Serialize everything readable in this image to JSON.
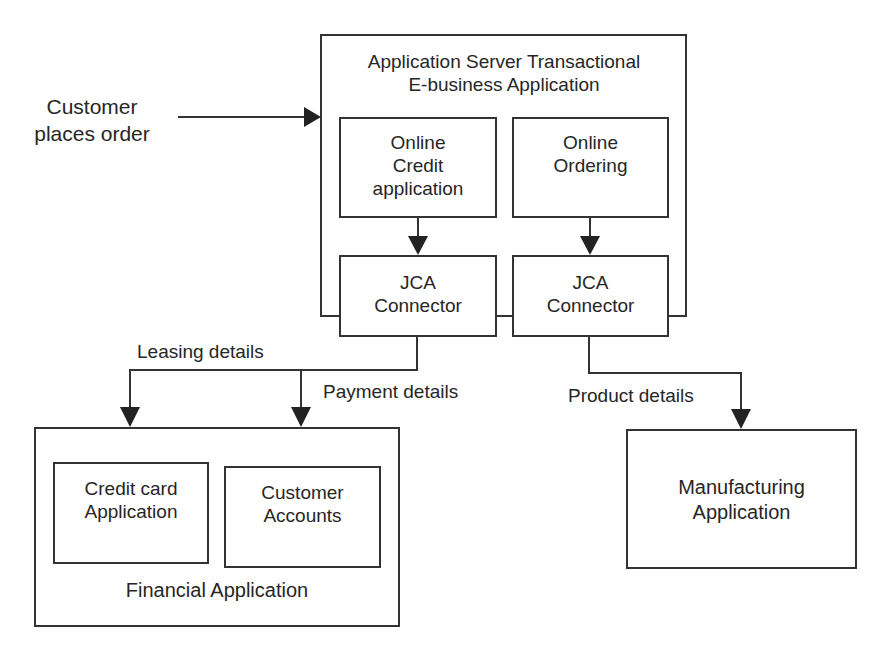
{
  "diagram": {
    "external_input": {
      "line1": "Customer",
      "line2": "places order"
    },
    "app_server": {
      "title_line1": "Application Server Transactional",
      "title_line2": "E-business Application",
      "modules": [
        {
          "line1": "Online",
          "line2": "Credit",
          "line3": "application"
        },
        {
          "line1": "Online",
          "line2": "Ordering",
          "line3": ""
        }
      ],
      "connectors": [
        {
          "line1": "JCA",
          "line2": "Connector"
        },
        {
          "line1": "JCA",
          "line2": "Connector"
        }
      ]
    },
    "flow_labels": {
      "leasing": "Leasing details",
      "payment": "Payment details",
      "product": "Product details"
    },
    "financial": {
      "title": "Financial Application",
      "modules": [
        {
          "line1": "Credit card",
          "line2": "Application"
        },
        {
          "line1": "Customer",
          "line2": "Accounts"
        }
      ]
    },
    "manufacturing": {
      "line1": "Manufacturing",
      "line2": "Application"
    }
  },
  "colors": {
    "line": "#333333",
    "text": "#262626",
    "background": "#ffffff"
  }
}
